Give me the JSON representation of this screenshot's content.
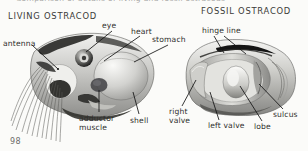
{
  "figure": {
    "caption_cutoff": "Comparison of details of living and fossil ostracods",
    "page_number": "98",
    "panels": [
      {
        "id": "living",
        "heading": "LIVING OSTRACOD",
        "labels": [
          {
            "id": "antenna",
            "text": "antenna"
          },
          {
            "id": "eye",
            "text": "eye"
          },
          {
            "id": "heart",
            "text": "heart"
          },
          {
            "id": "stomach",
            "text": "stomach"
          },
          {
            "id": "adductor",
            "text": "adductor muscle"
          },
          {
            "id": "shell",
            "text": "shell"
          }
        ]
      },
      {
        "id": "fossil",
        "heading": "FOSSIL OSTRACOD",
        "labels": [
          {
            "id": "hinge",
            "text": "hinge line"
          },
          {
            "id": "right",
            "text": "right valve"
          },
          {
            "id": "left",
            "text": "left valve"
          },
          {
            "id": "lobe",
            "text": "lobe"
          },
          {
            "id": "sulcus",
            "text": "sulcus"
          }
        ]
      }
    ]
  },
  "colors": {
    "page_background": "#fbfbf9",
    "ink": "#2e2e2c",
    "leader_line": "#141414",
    "heading": "#3a3a38",
    "caption_faded": "#a8a8a6"
  }
}
